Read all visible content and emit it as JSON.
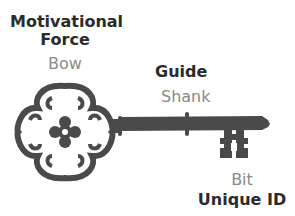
{
  "diagram": {
    "colors": {
      "key": "#4a4a4a",
      "role_text": "#2b2b2b",
      "part_text": "#8a8a8a",
      "background": "#ffffff"
    },
    "labels": {
      "bow": {
        "role_line1": "Motivational",
        "role_line2": "Force",
        "part": "Bow"
      },
      "shank": {
        "role": "Guide",
        "part": "Shank"
      },
      "bit": {
        "part": "Bit",
        "role": "Unique ID"
      }
    },
    "icon": "skeleton-key-icon"
  }
}
